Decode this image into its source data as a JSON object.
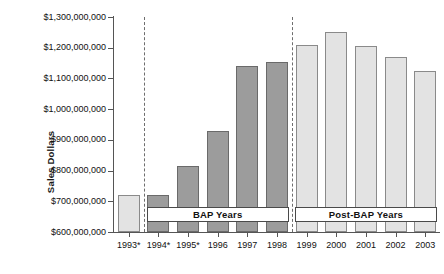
{
  "chart_data": {
    "type": "bar",
    "title": "",
    "xlabel": "",
    "ylabel": "Sales Dollars",
    "categories": [
      "1993*",
      "1994*",
      "1995*",
      "1996",
      "1997",
      "1998",
      "1999",
      "2000",
      "2001",
      "2002",
      "2003"
    ],
    "values": [
      720000000,
      720000000,
      815000000,
      930000000,
      1140000000,
      1152000000,
      1210000000,
      1250000000,
      1205000000,
      1170000000,
      1125000000
    ],
    "ylim": [
      600000000,
      1300000000
    ],
    "ytick_labels": [
      "$1,300,000,000",
      "$1,200,000,000",
      "$1,100,000,000",
      "$1,000,000,000",
      "$900,000,000",
      "$800,000,000",
      "$700,000,000",
      "$600,000,000"
    ],
    "ytick_values": [
      1300000000,
      1200000000,
      1100000000,
      1000000000,
      900000000,
      800000000,
      700000000,
      600000000
    ],
    "grid": false,
    "legend": "none",
    "series": [
      {
        "name": "Sales Dollars",
        "values": [
          720000000,
          720000000,
          815000000,
          930000000,
          1140000000,
          1152000000,
          1210000000,
          1250000000,
          1205000000,
          1170000000,
          1125000000
        ]
      }
    ],
    "bar_groups": [
      {
        "name": "pre-BAP",
        "categories": [
          "1993*"
        ],
        "fill": "#e3e3e3"
      },
      {
        "name": "BAP Years",
        "categories": [
          "1994*",
          "1995*",
          "1996",
          "1997",
          "1998"
        ],
        "fill": "#9c9c9c"
      },
      {
        "name": "Post-BAP Years",
        "categories": [
          "1999",
          "2000",
          "2001",
          "2002",
          "2003"
        ],
        "fill": "#e3e3e3"
      }
    ],
    "annotations": [
      {
        "label": "BAP Years",
        "spans": [
          "1994*",
          "1998"
        ]
      },
      {
        "label": "Post-BAP Years",
        "spans": [
          "1999",
          "2003"
        ]
      }
    ],
    "dividers": [
      {
        "after_category": "1993*"
      },
      {
        "after_category": "1998"
      }
    ],
    "colors": {
      "bap_bar_fill": "#9c9c9c",
      "other_bar_fill": "#e3e3e3",
      "bar_border": "#6e6e6e",
      "axis": "#555555",
      "divider": "#6d6d6d",
      "text": "#111111"
    }
  },
  "caption": ""
}
